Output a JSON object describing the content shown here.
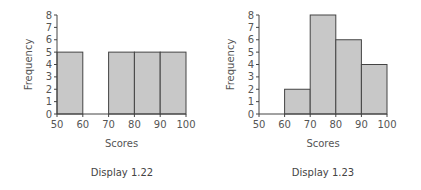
{
  "chart_data": [
    {
      "type": "bar",
      "subtype": "histogram",
      "title": "",
      "caption": "Display 1.22",
      "xlabel": "Scores",
      "ylabel": "Frequency",
      "bins": [
        [
          50,
          60
        ],
        [
          60,
          70
        ],
        [
          70,
          80
        ],
        [
          80,
          90
        ],
        [
          90,
          100
        ]
      ],
      "values": [
        5,
        0,
        5,
        5,
        5
      ],
      "xlim": [
        50,
        100
      ],
      "ylim": [
        0,
        8
      ],
      "x_ticks": [
        "50",
        "60",
        "70",
        "80",
        "90",
        "100"
      ],
      "y_ticks": [
        "0",
        "1",
        "2",
        "3",
        "4",
        "5",
        "6",
        "7",
        "8"
      ],
      "grid": false
    },
    {
      "type": "bar",
      "subtype": "histogram",
      "title": "",
      "caption": "Display 1.23",
      "xlabel": "Scores",
      "ylabel": "Frequency",
      "bins": [
        [
          50,
          60
        ],
        [
          60,
          70
        ],
        [
          70,
          80
        ],
        [
          80,
          90
        ],
        [
          90,
          100
        ]
      ],
      "values": [
        0,
        2,
        8,
        6,
        4
      ],
      "xlim": [
        50,
        100
      ],
      "ylim": [
        0,
        8
      ],
      "x_ticks": [
        "50",
        "60",
        "70",
        "80",
        "90",
        "100"
      ],
      "y_ticks": [
        "0",
        "1",
        "2",
        "3",
        "4",
        "5",
        "6",
        "7",
        "8"
      ],
      "grid": false
    }
  ],
  "colors": {
    "bar_fill": "#c8c8c8",
    "bar_stroke": "#444444"
  }
}
